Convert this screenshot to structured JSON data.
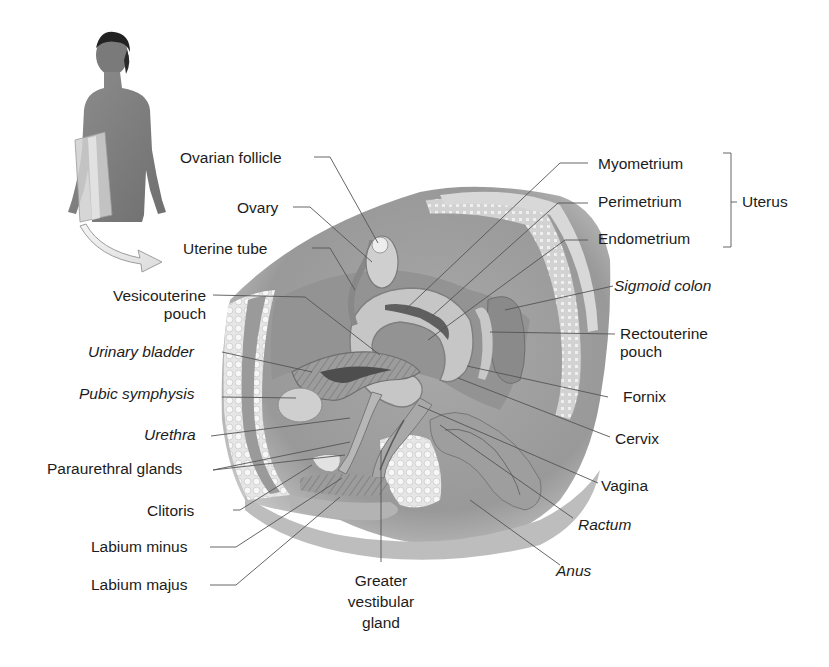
{
  "diagram": {
    "inset": {
      "description": "figure-with-sagittal-plane",
      "arrow": "curved-arrow"
    },
    "labels_left": [
      {
        "id": "ovarian-follicle",
        "text": "Ovarian follicle",
        "italic": false
      },
      {
        "id": "ovary",
        "text": "Ovary",
        "italic": false
      },
      {
        "id": "uterine-tube",
        "text": "Uterine tube",
        "italic": false
      },
      {
        "id": "vesicouterine-pouch",
        "line1": "Vesicouterine",
        "line2": "pouch",
        "italic": false
      },
      {
        "id": "urinary-bladder",
        "text": "Urinary bladder",
        "italic": true
      },
      {
        "id": "pubic-symphysis",
        "text": "Pubic symphysis",
        "italic": true
      },
      {
        "id": "urethra",
        "text": "Urethra",
        "italic": true
      },
      {
        "id": "paraurethral-glands",
        "text": "Paraurethral glands",
        "italic": false
      },
      {
        "id": "clitoris",
        "text": "Clitoris",
        "italic": false
      },
      {
        "id": "labium-minus",
        "text": "Labium minus",
        "italic": false
      },
      {
        "id": "labium-majus",
        "text": "Labium majus",
        "italic": false
      }
    ],
    "labels_bottom": [
      {
        "id": "greater-vestibular-gland",
        "line1": "Greater",
        "line2": "vestibular",
        "line3": "gland",
        "italic": false
      }
    ],
    "labels_right": [
      {
        "id": "myometrium",
        "text": "Myometrium",
        "italic": false
      },
      {
        "id": "perimetrium",
        "text": "Perimetrium",
        "italic": false
      },
      {
        "id": "endometrium",
        "text": "Endometrium",
        "italic": false
      },
      {
        "id": "sigmoid-colon",
        "text": "Sigmoid colon",
        "italic": true
      },
      {
        "id": "rectouterine-pouch",
        "line1": "Rectouterine",
        "line2": "pouch",
        "italic": false
      },
      {
        "id": "fornix",
        "text": "Fornix",
        "italic": false
      },
      {
        "id": "cervix",
        "text": "Cervix",
        "italic": false
      },
      {
        "id": "vagina",
        "text": "Vagina",
        "italic": false
      },
      {
        "id": "ractum",
        "text": "Ractum",
        "italic": true
      },
      {
        "id": "anus",
        "text": "Anus",
        "italic": true
      }
    ],
    "bracket_group": {
      "text": "Uterus",
      "members": [
        "Myometrium",
        "Perimetrium",
        "Endometrium"
      ]
    },
    "colors": {
      "ink": "#1c1c1c",
      "leader": "#555555",
      "tissue_dark": "#8a8a8a",
      "tissue_mid": "#b5b5b5",
      "tissue_light": "#dedede"
    }
  }
}
